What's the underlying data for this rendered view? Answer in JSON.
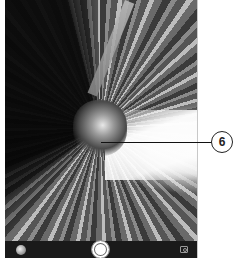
{
  "viewfinder": {
    "description": "Camera preview with radial zoom-blur effect"
  },
  "toolbar": {
    "gallery_icon": "gallery-thumbnail-icon",
    "shutter_icon": "shutter-button",
    "switch_icon": "switch-camera-icon",
    "background_color": "#1a1a1a"
  },
  "callout": {
    "number": "6"
  }
}
